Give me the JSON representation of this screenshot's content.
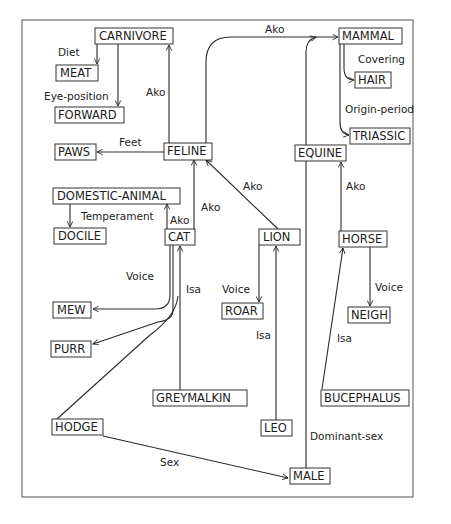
{
  "diagram": {
    "type": "semantic-network",
    "nodes": {
      "carnivore": "CARNIVORE",
      "meat": "MEAT",
      "forward": "FORWARD",
      "paws": "PAWS",
      "feline": "FELINE",
      "domestic_animal": "DOMESTIC-ANIMAL",
      "docile": "DOCILE",
      "cat": "CAT",
      "mew": "MEW",
      "purr": "PURR",
      "greymalkin": "GREYMALKIN",
      "hodge": "HODGE",
      "leo": "LEO",
      "male": "MALE",
      "lion": "LION",
      "roar": "ROAR",
      "horse": "HORSE",
      "neigh": "NEIGH",
      "bucephalus": "BUCEPHALUS",
      "equine": "EQUINE",
      "mammal": "MAMMAL",
      "hair": "HAIR",
      "triassic": "TRIASSIC"
    },
    "edge_labels": {
      "diet": "Diet",
      "eye_position": "Eye-position",
      "feet": "Feet",
      "feline_ako_carnivore": "Ako",
      "feline_ako_mammal": "Ako",
      "covering": "Covering",
      "origin_period": "Origin-period",
      "temperament": "Temperament",
      "cat_ako_domestic": "Ako",
      "cat_ako_feline": "Ako",
      "lion_ako_feline": "Ako",
      "horse_ako_equine": "Ako",
      "cat_voice": "Voice",
      "lion_voice": "Voice",
      "horse_voice": "Voice",
      "greymalkin_isa": "Isa",
      "leo_isa": "Isa",
      "bucephalus_isa": "Isa",
      "sex": "Sex",
      "dominant_sex": "Dominant-sex"
    },
    "edges": [
      {
        "from": "CARNIVORE",
        "to": "MEAT",
        "label": "Diet"
      },
      {
        "from": "CARNIVORE",
        "to": "FORWARD",
        "label": "Eye-position"
      },
      {
        "from": "FELINE",
        "to": "PAWS",
        "label": "Feet"
      },
      {
        "from": "FELINE",
        "to": "CARNIVORE",
        "label": "Ako"
      },
      {
        "from": "FELINE",
        "to": "MAMMAL",
        "label": "Ako"
      },
      {
        "from": "MAMMAL",
        "to": "HAIR",
        "label": "Covering"
      },
      {
        "from": "MAMMAL",
        "to": "TRIASSIC",
        "label": "Origin-period"
      },
      {
        "from": "DOMESTIC-ANIMAL",
        "to": "DOCILE",
        "label": "Temperament"
      },
      {
        "from": "CAT",
        "to": "DOMESTIC-ANIMAL",
        "label": "Ako"
      },
      {
        "from": "CAT",
        "to": "FELINE",
        "label": "Ako"
      },
      {
        "from": "LION",
        "to": "FELINE",
        "label": "Ako"
      },
      {
        "from": "HORSE",
        "to": "EQUINE",
        "label": "Ako"
      },
      {
        "from": "EQUINE",
        "to": "MAMMAL",
        "label": "Ako"
      },
      {
        "from": "CAT",
        "to": "MEW",
        "label": "Voice"
      },
      {
        "from": "CAT",
        "to": "PURR",
        "label": "Voice"
      },
      {
        "from": "LION",
        "to": "ROAR",
        "label": "Voice"
      },
      {
        "from": "HORSE",
        "to": "NEIGH",
        "label": "Voice"
      },
      {
        "from": "GREYMALKIN",
        "to": "CAT",
        "label": "Isa"
      },
      {
        "from": "HODGE",
        "to": "CAT",
        "label": "Isa"
      },
      {
        "from": "LEO",
        "to": "LION",
        "label": "Isa"
      },
      {
        "from": "BUCEPHALUS",
        "to": "HORSE",
        "label": "Isa"
      },
      {
        "from": "HODGE",
        "to": "MALE",
        "label": "Sex"
      },
      {
        "from": "MALE",
        "to": "MAMMAL",
        "label": "Dominant-sex"
      }
    ]
  }
}
